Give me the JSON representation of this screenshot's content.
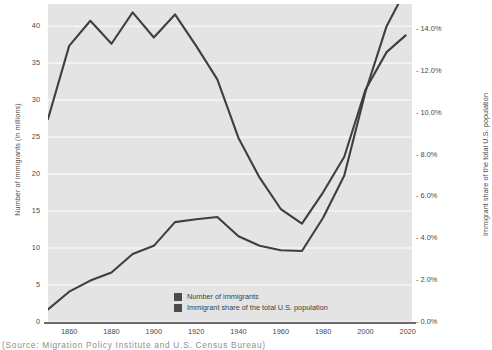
{
  "chart_data": {
    "type": "line",
    "title": "",
    "subtitle": "",
    "xlabel": "",
    "ylabel": "Number of immigrants (in millions)",
    "y2label": "Immigrant share of the total U.S. population",
    "grid": true,
    "legend_position": "inside-bottom-center",
    "xlim": [
      1850,
      2022
    ],
    "ylim": [
      0,
      43
    ],
    "y2lim": [
      0,
      15.2
    ],
    "xticks": [
      1860,
      1880,
      1900,
      1920,
      1940,
      1960,
      1980,
      2000,
      2020
    ],
    "xticklabels": [
      "1860",
      "1880",
      "1900",
      "1920",
      "1940",
      "1960",
      "1980",
      "2000",
      "2020"
    ],
    "yticks": [
      0,
      5,
      10,
      15,
      20,
      25,
      30,
      35,
      40
    ],
    "yticklabels": [
      "0",
      "5",
      "10",
      "15",
      "20",
      "25",
      "30",
      "35",
      "40"
    ],
    "y2ticks": [
      0,
      2,
      4,
      6,
      8,
      10,
      12,
      14
    ],
    "y2ticklabels": [
      "0.0%",
      "2.0%",
      "4.0%",
      "6.0%",
      "8.0%",
      "10.0%",
      "12.0%",
      "14.0%"
    ],
    "x": [
      1850,
      1860,
      1870,
      1880,
      1890,
      1900,
      1910,
      1920,
      1930,
      1940,
      1950,
      1960,
      1970,
      1980,
      1990,
      2000,
      2010,
      2019
    ],
    "series": [
      {
        "name": "Number of immigrants",
        "axis": "left",
        "units": "millions",
        "color": "#3f3f3f",
        "values": [
          1.7,
          4.1,
          5.6,
          6.7,
          9.2,
          10.3,
          13.5,
          13.9,
          14.2,
          11.6,
          10.3,
          9.7,
          9.6,
          14.1,
          19.8,
          31.1,
          40.0,
          44.9
        ]
      },
      {
        "name": "Immigrant share of the total U.S. population",
        "axis": "right",
        "units": "percent",
        "color": "#3f3f3f",
        "values": [
          9.7,
          13.2,
          14.4,
          13.3,
          14.8,
          13.6,
          14.7,
          13.2,
          11.6,
          8.8,
          6.9,
          5.4,
          4.7,
          6.2,
          7.9,
          11.1,
          12.9,
          13.7
        ]
      }
    ]
  },
  "legend": {
    "items": [
      {
        "label": "Number of immigrants",
        "color": "#4c4c4c"
      },
      {
        "label": "Immigrant share of the total U.S. population",
        "color": "#4c4c4c"
      }
    ]
  },
  "axes": {
    "left_title": "Number of immigrants (in millions)",
    "right_title": "Immigrant share of the total U.S. population"
  },
  "source_note": "(Source:  Migration  Policy  Institute  and U.S.  Census  Bureau)"
}
